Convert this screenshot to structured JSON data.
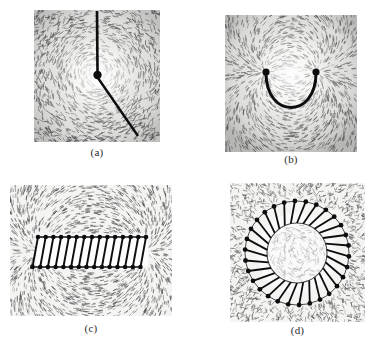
{
  "figure": {
    "background_color": "#ffffff",
    "filings_color": "#4a4a4a",
    "conductor_color": "#111111",
    "caption_color": "#2b2b2b",
    "panel_count": 4
  },
  "panels": [
    {
      "id": "a",
      "caption": "(a)",
      "subject": "straight current-carrying wire through a plane",
      "field_pattern": "concentric circles",
      "conductor_shape": "single straight wire entering at top and exiting lower-right, with a dot marking the wire cross-section at center",
      "wire_dot_radius": 4,
      "x": 34,
      "y": 10,
      "width": 126,
      "height": 132,
      "filings_density": 1400
    },
    {
      "id": "b",
      "caption": "(b)",
      "subject": "U-shaped current loop",
      "field_pattern": "field lines converging between the two loop ends",
      "conductor_shape": "U-shaped loop with two end dots at the top corners",
      "x": 225,
      "y": 15,
      "width": 132,
      "height": 137,
      "filings_density": 1500
    },
    {
      "id": "c",
      "caption": "(c)",
      "subject": "solenoid (straight coil)",
      "field_pattern": "uniform field inside, dipole field outside",
      "conductor_shape": "horizontal solenoid with slanted windings and dots at both ends of each turn",
      "turns": 14,
      "x": 10,
      "y": 185,
      "width": 162,
      "height": 131,
      "filings_density": 2000
    },
    {
      "id": "d",
      "caption": "(d)",
      "subject": "toroid (circular coil)",
      "field_pattern": "field confined inside the toroid ring",
      "conductor_shape": "ring of radial windings around a circular core, each with a dot on the outer end",
      "turns": 30,
      "x": 230,
      "y": 183,
      "width": 135,
      "height": 139,
      "filings_density": 1800
    }
  ]
}
